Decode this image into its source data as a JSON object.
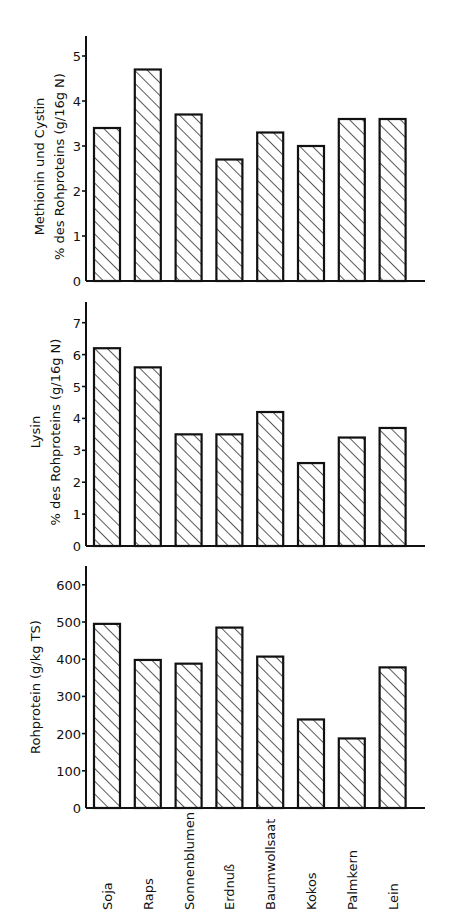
{
  "chart_data": [
    {
      "type": "bar",
      "title": "",
      "ylabel": [
        "Methionin und Cystin",
        "% des Rohproteins (g/16g N)"
      ],
      "xlabel": "",
      "ylim": [
        0,
        5.4
      ],
      "yticks": [
        0,
        1,
        2,
        3,
        4,
        5
      ],
      "grid": false,
      "categories": [
        "Soja",
        "Raps",
        "Sonnenblumen",
        "Erdnuß",
        "Baumwollsaat",
        "Kokos",
        "Palmkern",
        "Lein"
      ],
      "values": [
        3.4,
        4.7,
        3.7,
        2.7,
        3.3,
        3.0,
        3.6,
        3.6
      ]
    },
    {
      "type": "bar",
      "title": "",
      "ylabel": [
        "Lysin",
        "% des Rohproteins (g/16g N)"
      ],
      "xlabel": "",
      "ylim": [
        0,
        7.7
      ],
      "yticks": [
        0,
        1,
        2,
        3,
        4,
        5,
        6,
        7
      ],
      "grid": false,
      "categories": [
        "Soja",
        "Raps",
        "Sonnenblumen",
        "Erdnuß",
        "Baumwollsaat",
        "Kokos",
        "Palmkern",
        "Lein"
      ],
      "values": [
        6.2,
        5.6,
        3.5,
        3.5,
        4.2,
        2.6,
        3.4,
        3.7
      ]
    },
    {
      "type": "bar",
      "title": "",
      "ylabel": [
        "Rohprotein (g/kg TS)"
      ],
      "xlabel": "",
      "ylim": [
        0,
        660
      ],
      "yticks": [
        0,
        100,
        200,
        300,
        400,
        500,
        600
      ],
      "grid": false,
      "categories": [
        "Soja",
        "Raps",
        "Sonnenblumen",
        "Erdnuß",
        "Baumwollsaat",
        "Kokos",
        "Palmkern",
        "Lein"
      ],
      "values": [
        495,
        398,
        388,
        485,
        407,
        238,
        187,
        378
      ]
    }
  ],
  "colors": {
    "ink": "#111111",
    "background": "#ffffff"
  }
}
